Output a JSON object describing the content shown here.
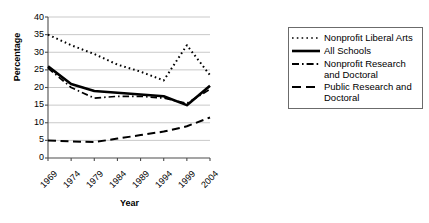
{
  "chart_data": {
    "type": "line",
    "title": "",
    "xlabel": "Year",
    "ylabel": "Percentage",
    "categories": [
      "1969",
      "1974",
      "1979",
      "1984",
      "1989",
      "1994",
      "1999",
      "2004"
    ],
    "x": [
      1969,
      1974,
      1979,
      1984,
      1989,
      1994,
      1999,
      2004
    ],
    "ylim": [
      0,
      40
    ],
    "ytick_labels": [
      "0",
      "5",
      "10",
      "15",
      "20",
      "25",
      "30",
      "35",
      "40"
    ],
    "yticks": [
      0,
      5,
      10,
      15,
      20,
      25,
      30,
      35,
      40
    ],
    "grid": true,
    "grid_axis": "y",
    "legend_position": "right",
    "series": [
      {
        "name": "Nonprofit Liberal Arts",
        "style": "dotted",
        "color": "#000000",
        "values": [
          35.0,
          32.0,
          29.5,
          26.5,
          24.5,
          22.0,
          32.0,
          23.5
        ]
      },
      {
        "name": "All Schools",
        "style": "solid",
        "color": "#000000",
        "values": [
          26.0,
          21.0,
          19.0,
          18.5,
          18.0,
          17.5,
          15.0,
          20.5
        ]
      },
      {
        "name": "Nonprofit Research and Doctoral",
        "style": "dash-dot",
        "color": "#000000",
        "values": [
          25.5,
          20.0,
          17.0,
          17.5,
          17.5,
          17.0,
          15.5,
          19.5
        ]
      },
      {
        "name": "Public Research and Doctoral",
        "style": "dashed",
        "color": "#000000",
        "values": [
          5.0,
          4.7,
          4.5,
          5.5,
          6.5,
          7.5,
          9.0,
          11.5
        ]
      }
    ]
  },
  "axis": {
    "y_title": "Percentage",
    "x_title": "Year",
    "y_ticks": [
      "40",
      "35",
      "30",
      "25",
      "20",
      "15",
      "10",
      "5",
      "0"
    ],
    "x_ticks": [
      "1969",
      "1974",
      "1979",
      "1984",
      "1989",
      "1994",
      "1999",
      "2004"
    ]
  },
  "legend": {
    "entries": [
      {
        "label": "Nonprofit Liberal Arts",
        "swatch": "dotted-line-swatch"
      },
      {
        "label": "All Schools",
        "swatch": "solid-line-swatch"
      },
      {
        "label": "Nonprofit Research and Doctoral",
        "swatch": "dash-dot-line-swatch"
      },
      {
        "label": "Public Research and Doctoral",
        "swatch": "dashed-line-swatch"
      }
    ]
  }
}
